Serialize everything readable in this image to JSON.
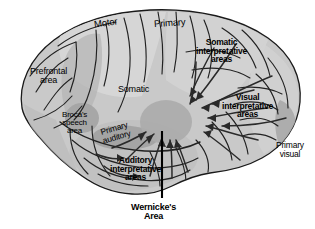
{
  "figure": {
    "background_color": "#ffffff",
    "outline_color": "#1a1a1a",
    "colors": {
      "cortex_base": "#c9c9c9",
      "cortex_light": "#dadada",
      "cortex_mid": "#bcbcbc",
      "shade_dark": "#a6a6a6",
      "hub_gray": "#b0b0b0",
      "line": "#1a1a1a"
    }
  },
  "labels": [
    {
      "id": "motor",
      "name": "motor",
      "text": "Motor",
      "lines": [
        "Motor"
      ],
      "weight": "plain",
      "font_size": 9.5,
      "x": 94,
      "y": 18,
      "rotate": -8
    },
    {
      "id": "primary",
      "name": "primary-motor-sensory",
      "text": "Primary",
      "lines": [
        "Primary"
      ],
      "weight": "plain",
      "font_size": 9.5,
      "x": 154,
      "y": 18,
      "rotate": -4
    },
    {
      "id": "somatic_interpretative",
      "name": "somatic-interpretative-areas",
      "text": "Somatic interpretative areas",
      "lines": [
        "Somatic",
        "interpretative",
        "areas"
      ],
      "weight": "bold",
      "font_size": 8.5,
      "x": 196,
      "y": 38,
      "rotate": 0
    },
    {
      "id": "prefrontal",
      "name": "prefrontal-area",
      "text": "Prefrontal area",
      "lines": [
        "Prefrontal",
        "area"
      ],
      "weight": "plain",
      "font_size": 9,
      "x": 30,
      "y": 67,
      "rotate": 0
    },
    {
      "id": "somatic",
      "name": "somatic",
      "text": "Somatic",
      "lines": [
        "Somatic"
      ],
      "weight": "plain",
      "font_size": 9,
      "x": 118,
      "y": 85,
      "rotate": 0
    },
    {
      "id": "visual_interpretative",
      "name": "visual-interpretative-areas",
      "text": "Visual interpretative areas",
      "lines": [
        "Visual",
        "interpretative",
        "areas"
      ],
      "weight": "bold",
      "font_size": 8.5,
      "x": 222,
      "y": 93,
      "rotate": 0
    },
    {
      "id": "brocas",
      "name": "brocas-speech-area",
      "text": "Broca's speech area",
      "lines": [
        "Broca's",
        "speech",
        "area"
      ],
      "weight": "plain",
      "font_size": 8,
      "x": 62,
      "y": 111,
      "rotate": 0
    },
    {
      "id": "primary_auditory",
      "name": "primary-auditory",
      "text": "Primary auditory",
      "lines": [
        "Primary",
        "auditory"
      ],
      "weight": "plain",
      "font_size": 8.5,
      "x": 101,
      "y": 124,
      "rotate": -16
    },
    {
      "id": "auditory_interpretative",
      "name": "auditory-interpretative-areas",
      "text": "Auditory interpretative areas",
      "lines": [
        "Auditory",
        "interpretative",
        "areas"
      ],
      "weight": "bold",
      "font_size": 8.5,
      "x": 110,
      "y": 156,
      "rotate": 0
    },
    {
      "id": "primary_visual",
      "name": "primary-visual",
      "text": "Primary visual",
      "lines": [
        "Primary",
        "visual"
      ],
      "weight": "plain",
      "font_size": 8.5,
      "x": 276,
      "y": 141,
      "rotate": 0
    },
    {
      "id": "wernickes",
      "name": "wernickes-area",
      "text": "Wernicke's Area",
      "lines": [
        "Wernicke's",
        "Area"
      ],
      "weight": "bold",
      "font_size": 9,
      "x": 131,
      "y": 203,
      "rotate": 0
    }
  ],
  "leader_line": {
    "name": "wernickes-leader-line",
    "x": 162,
    "y_top": 131,
    "y_bottom": 198
  }
}
